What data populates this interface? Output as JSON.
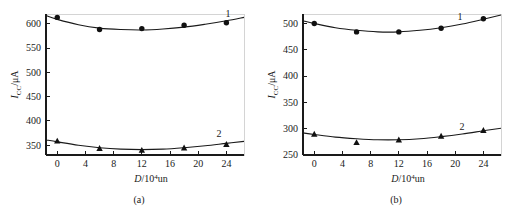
{
  "figure": {
    "background": "#ffffff",
    "ink_color": "#1a1a1a",
    "panels": [
      {
        "caption": "(a)",
        "xlabel_var": "D",
        "xlabel_rest": "/10",
        "xlabel_exp": "4",
        "xlabel_unit": "un",
        "ylabel_var": "I",
        "ylabel_sub": "CC",
        "ylabel_rest": "/μA",
        "series_label_1": "1",
        "series_label_2": "2"
      },
      {
        "caption": "(b)",
        "xlabel_var": "D",
        "xlabel_rest": "/10",
        "xlabel_exp": "4",
        "xlabel_unit": "un",
        "ylabel_var": "I",
        "ylabel_sub": "CC",
        "ylabel_rest": "/μA",
        "series_label_1": "1",
        "series_label_2": "2"
      }
    ]
  },
  "chart_data": [
    {
      "type": "scatter",
      "panel": "(a)",
      "title": "",
      "xlabel": "D/10^4 un",
      "ylabel": "I_CC/μA",
      "xlim": [
        -1.6,
        26.5
      ],
      "ylim": [
        330,
        620
      ],
      "xticks": [
        0,
        4,
        8,
        12,
        16,
        20,
        24
      ],
      "xtick_labels": [
        "0",
        "4",
        "8",
        "12",
        "16",
        "20",
        "24"
      ],
      "yticks": [
        350,
        400,
        450,
        500,
        550,
        600
      ],
      "ytick_labels": [
        "350",
        "400",
        "450",
        "500",
        "550",
        "600"
      ],
      "grid": false,
      "legend": "inline-curve-numbers",
      "series": [
        {
          "name": "1",
          "marker": "circle",
          "x": [
            0,
            6,
            12,
            18,
            24
          ],
          "values": [
            613,
            588,
            590,
            597,
            602
          ],
          "fit_curve": {
            "x": [
              -1.6,
              0,
              3,
              6,
              9,
              12,
              15,
              18,
              21,
              24,
              26.5
            ],
            "y": [
              617,
              609,
              598,
              591,
              588,
              587,
              589,
              593,
              599,
              606,
              613
            ]
          }
        },
        {
          "name": "2",
          "marker": "triangle",
          "x": [
            0,
            6,
            12,
            18,
            24
          ],
          "values": [
            359,
            344,
            340,
            345,
            352
          ],
          "fit_curve": {
            "x": [
              -1.6,
              0,
              3,
              6,
              9,
              12,
              15,
              18,
              21,
              24,
              26.5
            ],
            "y": [
              361,
              357,
              350,
              345,
              342,
              341,
              342,
              345,
              349,
              354,
              358
            ]
          }
        }
      ]
    },
    {
      "type": "scatter",
      "panel": "(b)",
      "title": "",
      "xlabel": "D/10^4 un",
      "ylabel": "I_CC/μA",
      "xlim": [
        -1.6,
        26.5
      ],
      "ylim": [
        250,
        518
      ],
      "xticks": [
        0,
        4,
        8,
        12,
        16,
        20,
        24
      ],
      "xtick_labels": [
        "0",
        "4",
        "8",
        "12",
        "16",
        "20",
        "24"
      ],
      "yticks": [
        250,
        300,
        350,
        400,
        450,
        500
      ],
      "ytick_labels": [
        "250",
        "300",
        "350",
        "400",
        "450",
        "500"
      ],
      "grid": false,
      "legend": "inline-curve-numbers",
      "series": [
        {
          "name": "1",
          "marker": "circle",
          "x": [
            0,
            6,
            12,
            18,
            24
          ],
          "values": [
            500,
            484,
            484,
            491,
            509
          ],
          "fit_curve": {
            "x": [
              -1.6,
              0,
              3,
              6,
              9,
              12,
              15,
              18,
              21,
              24,
              26.5
            ],
            "y": [
              505,
              500,
              492,
              487,
              484,
              484,
              487,
              492,
              499,
              508,
              516
            ]
          }
        },
        {
          "name": "2",
          "marker": "triangle",
          "x": [
            0,
            6,
            12,
            18,
            24
          ],
          "values": [
            290,
            274,
            279,
            286,
            297
          ],
          "fit_curve": {
            "x": [
              -1.6,
              0,
              3,
              6,
              9,
              12,
              15,
              18,
              21,
              24,
              26.5
            ],
            "y": [
              292,
              289,
              284,
              281,
              279,
              279,
              281,
              285,
              290,
              296,
              301
            ]
          }
        }
      ]
    }
  ]
}
